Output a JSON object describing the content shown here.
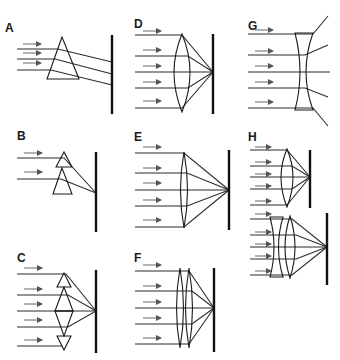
{
  "figure": {
    "panels": [
      {
        "id": "A",
        "label": "A",
        "optic": "single prism",
        "behavior": "rays deflected, parallel, not focused"
      },
      {
        "id": "B",
        "label": "B",
        "optic": "two stacked prisms",
        "behavior": "rays converge to one point"
      },
      {
        "id": "C",
        "label": "C",
        "optic": "stacked prisms forming lens shape",
        "behavior": "rays converge to one point"
      },
      {
        "id": "D",
        "label": "D",
        "optic": "thick biconvex lens",
        "behavior": "rays converge to focal point"
      },
      {
        "id": "E",
        "label": "E",
        "optic": "thin biconvex lens",
        "behavior": "rays converge to focal point, longer focal length"
      },
      {
        "id": "F",
        "label": "F",
        "optic": "two thin biconvex lenses in contact",
        "behavior": "rays converge to focal point"
      },
      {
        "id": "G",
        "label": "G",
        "optic": "biconcave lens",
        "behavior": "rays diverge"
      },
      {
        "id": "H",
        "label": "H",
        "optic": "convex lens; concave + convex lens combination",
        "behavior": "combination lengthens focal distance"
      }
    ]
  },
  "colors": {
    "background": "#ffffff",
    "ray": "#2b2b2b",
    "arrow": "#555555",
    "screen": "#111111"
  }
}
